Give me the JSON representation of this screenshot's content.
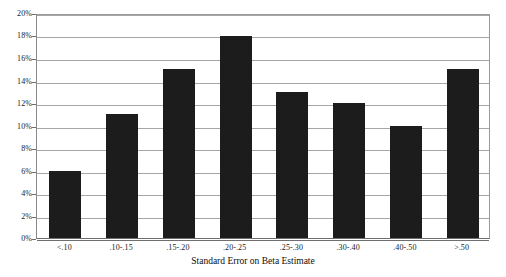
{
  "chart_data": {
    "type": "bar",
    "title": "",
    "xlabel": "Standard Error on Beta Estimate",
    "ylabel": "",
    "categories": [
      "<.10",
      ".10-.15",
      ".15-.20",
      ".20-.25",
      ".25-.30",
      ".30-.40",
      ".40-.50",
      ">.50"
    ],
    "values": [
      6,
      11,
      15,
      18,
      13,
      12,
      10,
      15
    ],
    "value_unit": "%",
    "ylim": [
      0,
      20
    ],
    "ytick_step": 2,
    "ytick_labels": [
      "20%",
      "18%",
      "16%",
      "14%",
      "12%",
      "10%",
      "8%",
      "6%",
      "4%",
      "2%",
      "0%"
    ],
    "ytick_values": [
      20,
      18,
      16,
      14,
      12,
      10,
      8,
      6,
      4,
      2,
      0
    ],
    "grid": true,
    "grid_axis": "y",
    "legend": false,
    "bar_color": "#1c1c1c",
    "gridline_color": "#a6a6a6",
    "axis_color": "#6e6e6e",
    "background_color": "#ffffff"
  }
}
